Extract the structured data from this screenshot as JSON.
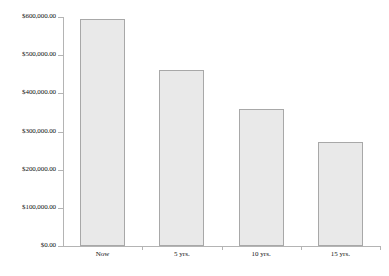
{
  "chart_data": {
    "type": "bar",
    "title": "",
    "xlabel": "",
    "ylabel": "",
    "categories": [
      "Now",
      "5 yrs.",
      "10 yrs.",
      "15 yrs."
    ],
    "values": [
      595000,
      460000,
      358000,
      273000
    ],
    "ylim": [
      0,
      600000
    ],
    "y_ticks": [
      0,
      100000,
      200000,
      300000,
      400000,
      500000,
      600000
    ],
    "y_tick_labels": [
      "$0.00",
      "$100,000.00",
      "$200,000.00",
      "$300,000.00",
      "$400,000.00",
      "$500,000.00",
      "$600,000.00"
    ],
    "grid": false,
    "legend": false,
    "bar_fill_color": "#e9e9e9",
    "bar_border_color": "#a8a8a8",
    "axis_color": "#b4b4b4"
  }
}
